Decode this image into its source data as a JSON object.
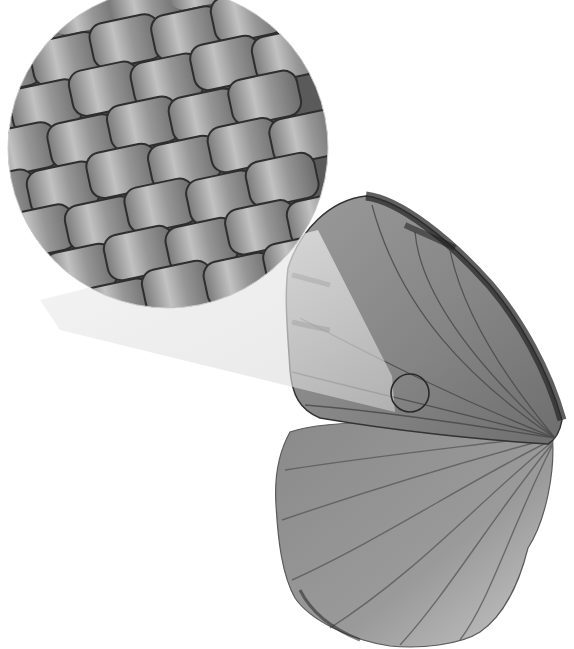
{
  "figure": {
    "background": "#ffffff",
    "colors": {
      "wing_base": "#8c8c8c",
      "wing_light": "#b4b4b4",
      "wing_dark": "#3a3a3a",
      "vein": "#4a4a4a",
      "scale_face": "#8f8f8f",
      "scale_highlight": "#c4c4c4",
      "scale_shadow": "#2e2e2e",
      "beam": "#e8e8e8"
    },
    "inset": {
      "cx": 168,
      "cy": 148,
      "r": 160
    },
    "focus_circle": {
      "cx": 410,
      "cy": 393,
      "r": 19
    },
    "label": "Butterfly wing scales (magnified)"
  }
}
